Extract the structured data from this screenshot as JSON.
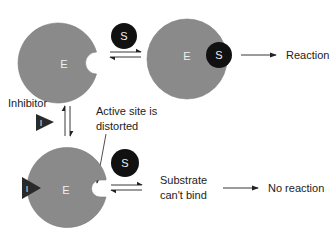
{
  "diagram": {
    "type": "enzyme-inhibition-schematic",
    "colors": {
      "enzyme": "#8a8a8a",
      "substrate": "#111111",
      "inhibitor": "#2a2a2a",
      "text": "#222222"
    },
    "nodes": {
      "enzyme_free": {
        "label": "E"
      },
      "substrate_top": {
        "label": "S"
      },
      "enzyme_substrate_complex": {
        "enzyme_label": "E",
        "substrate_label": "S"
      },
      "inhibitor": {
        "label": "I",
        "caption": "Inhibitor"
      },
      "enzyme_inhibited": {
        "enzyme_label": "E",
        "inhibitor_label": "I"
      },
      "substrate_bottom": {
        "label": "S"
      }
    },
    "labels": {
      "reaction": "Reaction",
      "active_site_line1": "Active site is",
      "active_site_line2": "distorted",
      "substrate_line1": "Substrate",
      "substrate_line2": "can't bind",
      "no_reaction": "No reaction"
    },
    "edges": [
      {
        "from": "E + S",
        "to": "ES",
        "type": "reversible"
      },
      {
        "from": "ES",
        "to": "Reaction",
        "type": "forward"
      },
      {
        "from": "E",
        "to": "EI",
        "type": "reversible",
        "via": "Inhibitor"
      },
      {
        "from": "EI + S",
        "to": "Substrate can't bind",
        "type": "reversible"
      },
      {
        "from": "Substrate can't bind",
        "to": "No reaction",
        "type": "forward"
      }
    ]
  }
}
